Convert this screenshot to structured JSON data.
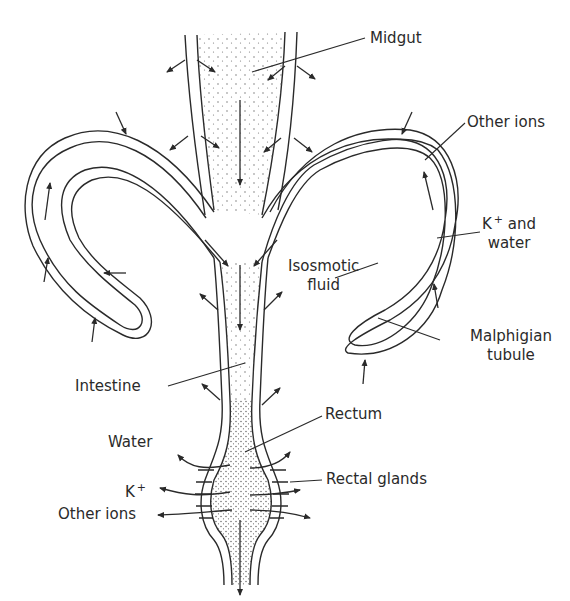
{
  "diagram": {
    "type": "anatomical",
    "colors": {
      "line": "#2a2a2a",
      "stipple": "#555555",
      "background": "#ffffff"
    }
  },
  "labels": {
    "midgut": "Midgut",
    "other_ions_top": "Other ions",
    "k_and_water_k": "K",
    "k_and_water_sup": "+",
    "k_and_water_rest": "and",
    "k_and_water_line2": "water",
    "isosmotic_line1": "Isosmotic",
    "isosmotic_line2": "fluid",
    "malpighian_line1": "Malphigian",
    "malpighian_line2": "tubule",
    "intestine": "Intestine",
    "rectum": "Rectum",
    "rectal_glands": "Rectal glands",
    "water": "Water",
    "k_left": "K",
    "k_left_sup": "+",
    "other_ions_left": "Other ions"
  }
}
